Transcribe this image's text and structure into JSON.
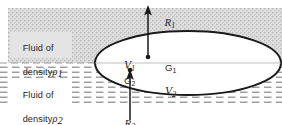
{
  "figure": {
    "background_color": "#ffffff",
    "upper_fluid_fill": "#d9d9d9",
    "lower_fluid_hatch_color": "#8c8c8c",
    "outline_color": "#1a1a1a",
    "text_color": "#262626"
  },
  "labels": {
    "fluid_upper_line1": "Fluid of",
    "fluid_upper_line2": "density",
    "fluid_upper_symbol": "ρ",
    "fluid_upper_sub": "1",
    "fluid_lower_line1": "Fluid of",
    "fluid_lower_line2": "density",
    "fluid_lower_symbol": "ρ",
    "fluid_lower_sub": "2",
    "volume_upper": "V",
    "volume_upper_sub": "1",
    "volume_lower": "V",
    "volume_lower_sub": "2",
    "centroid_upper": "G",
    "centroid_upper_sub": "1",
    "centroid_lower": "G",
    "centroid_lower_sub": "2",
    "force_upper": "R",
    "force_upper_sub": "1",
    "force_lower": "R",
    "force_lower_sub": "2"
  },
  "geometry": {
    "body_center_x": 188,
    "body_center_y": 63,
    "body_rx": 93,
    "body_ry": 32,
    "interface_y": 63,
    "force_upper_arrow_x": 148,
    "force_upper_arrow_tip_y": 6,
    "force_upper_arrow_base_y": 57,
    "force_lower_arrow_x": 130,
    "force_lower_arrow_tip_y": 70,
    "force_lower_arrow_base_y": 118,
    "centroid_upper_x": 148,
    "centroid_upper_y": 57,
    "centroid_lower_x": 130,
    "centroid_lower_y": 70
  }
}
